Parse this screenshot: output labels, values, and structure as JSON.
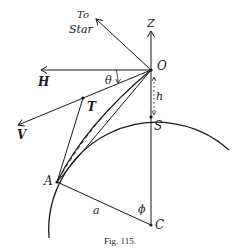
{
  "figure": {
    "caption": "Fig. 115.",
    "labels": {
      "to_star_line1": "To",
      "to_star_line2": "Star",
      "Z": "Z",
      "O": "O",
      "H": "H",
      "theta": "θ",
      "h": "h",
      "T": "T",
      "V": "V",
      "S": "S",
      "A": "A",
      "a": "a",
      "phi": "ϕ",
      "C": "C"
    },
    "colors": {
      "ink": "#1a1a1a",
      "background": "#ffffff"
    }
  }
}
